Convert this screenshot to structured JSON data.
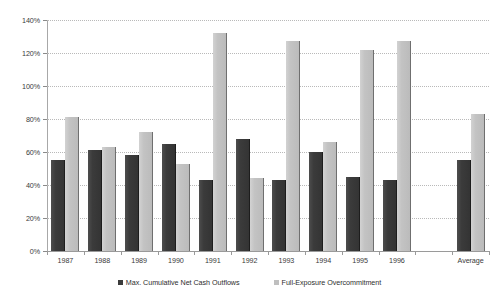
{
  "chart_data": {
    "type": "bar",
    "title": "",
    "xlabel": "",
    "ylabel": "",
    "ylim": [
      0,
      140
    ],
    "y_tick_step": 20,
    "y_ticks": [
      "0%",
      "20%",
      "40%",
      "60%",
      "80%",
      "100%",
      "120%",
      "140%"
    ],
    "grid": true,
    "grid_style": "horizontal-dotted",
    "legend_position": "bottom-center",
    "categories": [
      "1987",
      "1988",
      "1989",
      "1990",
      "1991",
      "1992",
      "1993",
      "1994",
      "1995",
      "1996",
      "",
      "Average"
    ],
    "series": [
      {
        "name": "Max. Cumulative Net Cash Outflows",
        "color": "#3b3b3b",
        "values": [
          55,
          61,
          58,
          65,
          43,
          68,
          43,
          60,
          45,
          43,
          null,
          55
        ]
      },
      {
        "name": "Full-Exposure Overcommitment",
        "color": "#bfbfbf",
        "values": [
          81,
          63,
          72,
          53,
          132,
          44,
          127,
          66,
          122,
          127,
          null,
          83
        ]
      }
    ]
  },
  "legend": {
    "items": [
      {
        "label": "Max. Cumulative Net Cash Outflows",
        "swatch": "dark"
      },
      {
        "label": "Full-Exposure Overcommitment",
        "swatch": "light"
      }
    ]
  }
}
